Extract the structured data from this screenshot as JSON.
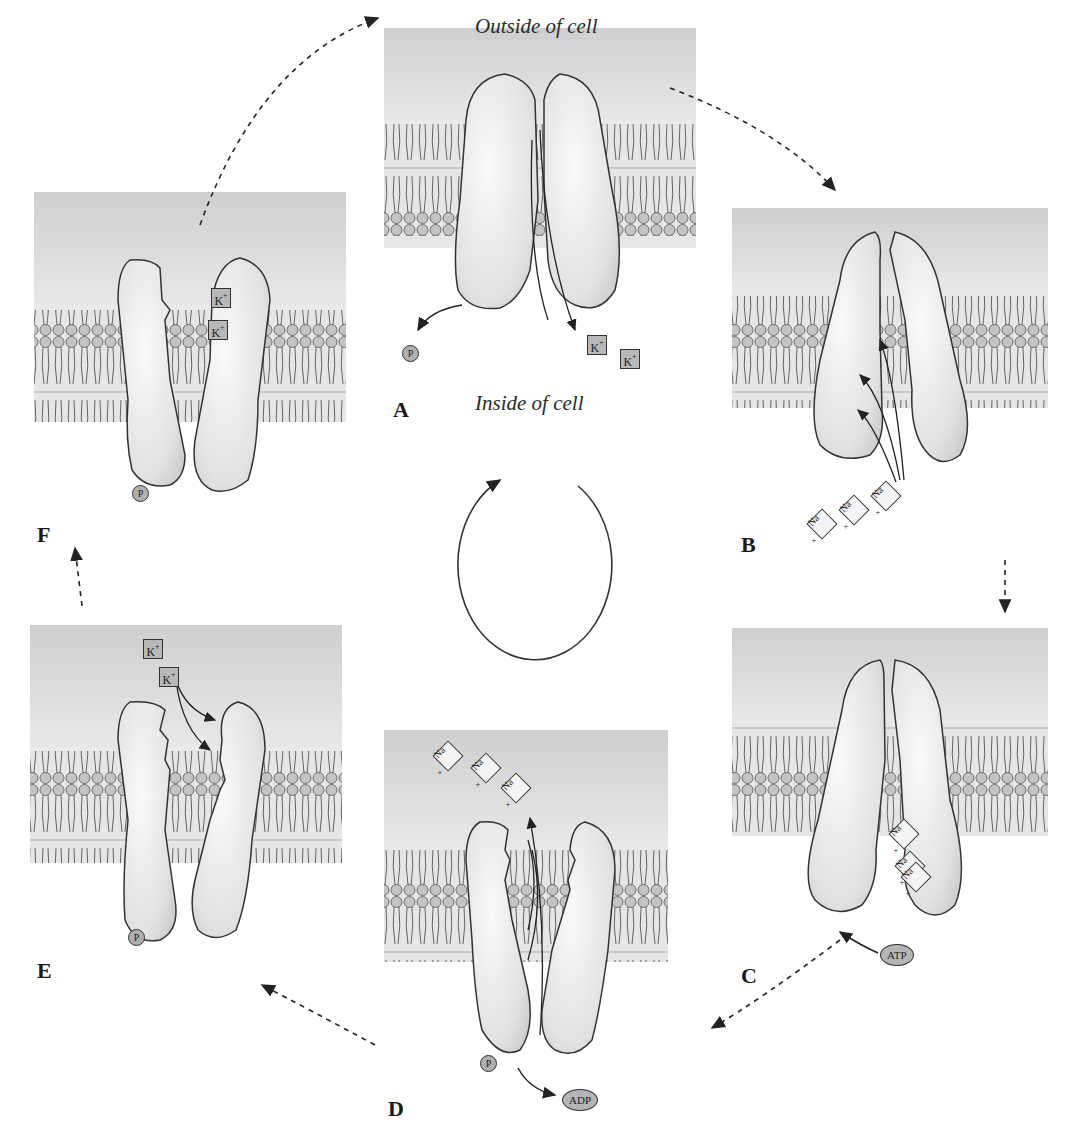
{
  "diagram": {
    "type": "sodium-potassium pump cycle",
    "region_labels": {
      "outside": "Outside of cell",
      "inside": "Inside of cell"
    },
    "stages": [
      {
        "id": "A",
        "label": "A",
        "ions": [
          "K+",
          "K+"
        ],
        "molecules": [
          "P"
        ],
        "description": "Pump opens inward, releases 2 K+ and phosphate into cell"
      },
      {
        "id": "B",
        "label": "B",
        "ions": [
          "Na+",
          "Na+",
          "Na+"
        ],
        "molecules": [],
        "description": "3 Na+ bind from inside"
      },
      {
        "id": "C",
        "label": "C",
        "ions": [
          "Na+",
          "Na+",
          "Na+"
        ],
        "molecules": [
          "ATP"
        ],
        "description": "ATP phosphorylates pump with Na+ bound"
      },
      {
        "id": "D",
        "label": "D",
        "ions": [
          "Na+",
          "Na+",
          "Na+"
        ],
        "molecules": [
          "P",
          "ADP"
        ],
        "description": "Pump opens outward, releases 3 Na+ outside; ADP released"
      },
      {
        "id": "E",
        "label": "E",
        "ions": [
          "K+",
          "K+"
        ],
        "molecules": [
          "P"
        ],
        "description": "2 K+ bind from outside"
      },
      {
        "id": "F",
        "label": "F",
        "ions": [
          "K+",
          "K+"
        ],
        "molecules": [
          "P"
        ],
        "description": "K+ bound, phosphorylated pump"
      }
    ],
    "ion_labels": {
      "potassium": "K",
      "sodium": "Na",
      "charge": "+"
    },
    "molecule_labels": {
      "phosphate": "P",
      "atp": "ATP",
      "adp": "ADP"
    },
    "colors": {
      "extracellular": "#d2d2d2",
      "protein": "#ececec",
      "outline": "#333333",
      "membrane": "#a9a9a9"
    }
  }
}
